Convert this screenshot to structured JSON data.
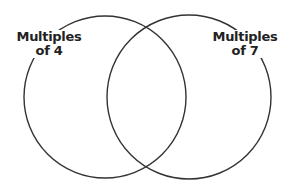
{
  "diagram": {
    "type": "venn",
    "sets": [
      {
        "id": "left",
        "label_line1": "Multiples",
        "label_line2": "of 4",
        "cx": 105,
        "cy": 97,
        "r": 81
      },
      {
        "id": "right",
        "label_line1": "Multiples",
        "label_line2": "of 7",
        "cx": 189,
        "cy": 97,
        "r": 82
      }
    ],
    "stroke_color": "#333333",
    "background": "#ffffff"
  }
}
